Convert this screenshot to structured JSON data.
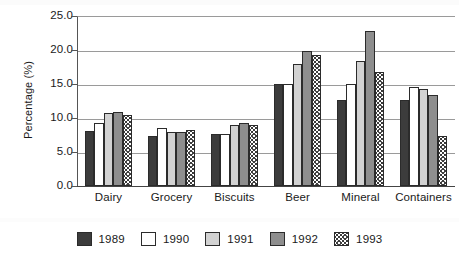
{
  "chart_data": {
    "type": "bar",
    "title": "",
    "xlabel": "",
    "ylabel": "Percentage (%)",
    "ylim": [
      0.0,
      25.0
    ],
    "ytick_step": 5.0,
    "ytick_labels": [
      "25.0",
      "20.0",
      "15.0",
      "10.0",
      "5.0",
      "0.0"
    ],
    "ytick_values": [
      25.0,
      20.0,
      15.0,
      10.0,
      5.0,
      0.0
    ],
    "grid": true,
    "grid_axis": "y",
    "legend_position": "bottom",
    "categories": [
      "Dairy",
      "Grocery",
      "Biscuits",
      "Beer",
      "Mineral",
      "Containers"
    ],
    "series": [
      {
        "name": "1989",
        "color": "#3c3c3c",
        "pattern": "solid-dark",
        "values": [
          8.1,
          7.4,
          7.6,
          15.0,
          12.7,
          12.6
        ]
      },
      {
        "name": "1990",
        "color": "#ffffff",
        "pattern": "solid-white",
        "values": [
          9.2,
          8.5,
          7.6,
          15.0,
          15.0,
          14.6
        ]
      },
      {
        "name": "1991",
        "color": "#d2d2d2",
        "pattern": "solid-light",
        "values": [
          10.7,
          8.0,
          9.0,
          18.0,
          18.4,
          14.2
        ]
      },
      {
        "name": "1992",
        "color": "#8e8e8e",
        "pattern": "solid-medium",
        "values": [
          10.9,
          8.0,
          9.3,
          19.8,
          22.8,
          13.4
        ]
      },
      {
        "name": "1993",
        "color": "#ffffff",
        "pattern": "speckled",
        "values": [
          10.4,
          8.2,
          9.0,
          19.2,
          16.8,
          7.3
        ]
      }
    ]
  },
  "axes": {
    "y_title": "Percentage (%)"
  },
  "legend": {
    "entries": [
      {
        "label": "1989",
        "swatch": "legend-swatch-1989"
      },
      {
        "label": "1990",
        "swatch": "legend-swatch-1990"
      },
      {
        "label": "1991",
        "swatch": "legend-swatch-1991"
      },
      {
        "label": "1992",
        "swatch": "legend-swatch-1992"
      },
      {
        "label": "1993",
        "swatch": "legend-swatch-1993"
      }
    ]
  },
  "colors": {
    "series_1989": "#3c3c3c",
    "series_1990": "#ffffff",
    "series_1991": "#d2d2d2",
    "series_1992": "#8e8e8e",
    "series_1993": "#ffffff",
    "bar_outline": "#2b2b2b",
    "gridline": "#9a9a9a",
    "axis": "#444444",
    "background": "#ffffff",
    "text": "#1a1a1a"
  }
}
